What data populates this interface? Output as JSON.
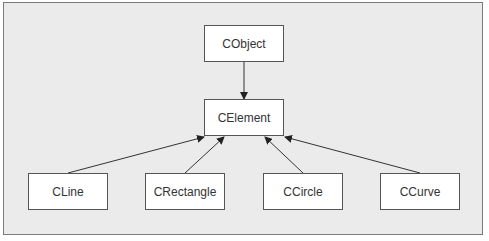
{
  "diagram": {
    "type": "class-hierarchy",
    "background_color": "#ebebeb",
    "box_color": "#ffffff",
    "border_color": "#555555",
    "line_color": "#333333",
    "nodes": [
      {
        "id": "cobject",
        "label": "CObject"
      },
      {
        "id": "celement",
        "label": "CElement"
      },
      {
        "id": "cline",
        "label": "CLine"
      },
      {
        "id": "crectangle",
        "label": "CRectangle"
      },
      {
        "id": "ccircle",
        "label": "CCircle"
      },
      {
        "id": "ccurve",
        "label": "CCurve"
      }
    ],
    "edges": [
      {
        "from": "cobject",
        "to": "celement",
        "arrow": "to"
      },
      {
        "from": "cline",
        "to": "celement",
        "arrow": "to"
      },
      {
        "from": "crectangle",
        "to": "celement",
        "arrow": "to"
      },
      {
        "from": "ccircle",
        "to": "celement",
        "arrow": "to"
      },
      {
        "from": "ccurve",
        "to": "celement",
        "arrow": "to"
      }
    ]
  }
}
